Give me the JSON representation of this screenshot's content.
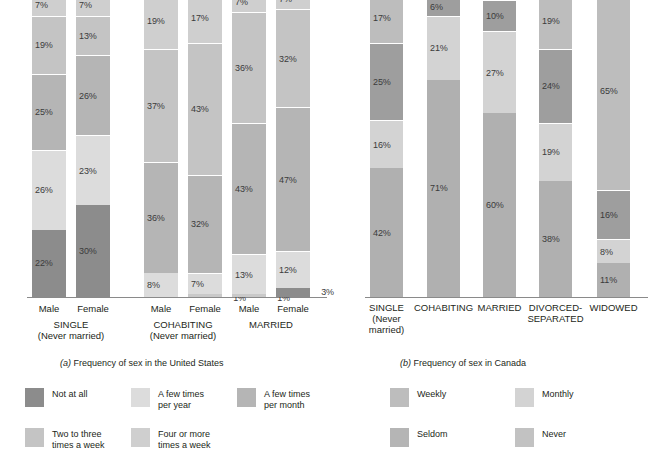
{
  "chart_data": [
    {
      "type": "bar",
      "id": "us",
      "title": "Frequency of sex in the United States",
      "caption_prefix": "(a)",
      "stacked": true,
      "orientation": "vertical",
      "normalized_percent": true,
      "ylim": [
        0,
        100
      ],
      "grid": false,
      "legend_position": "bottom-left",
      "categories": [
        "SINGLE\n(Never married)",
        "COHABITING\n(Never married)",
        "MARRIED"
      ],
      "subcategories": [
        "Male",
        "Female"
      ],
      "series": [
        {
          "name": "Not at all",
          "color": "#8c8c8c",
          "values": [
            22,
            30,
            0,
            0,
            0,
            3
          ]
        },
        {
          "name": "A few times per year",
          "color": "#dcdcdc",
          "values": [
            26,
            23,
            8,
            7,
            13,
            12
          ]
        },
        {
          "name": "A few times per month",
          "color": "#b5b5b5",
          "values": [
            25,
            26,
            36,
            32,
            43,
            47
          ]
        },
        {
          "name": "Two to three times a week",
          "color": "#c4c4c4",
          "values": [
            19,
            13,
            37,
            43,
            36,
            32
          ]
        },
        {
          "name": "Four or more times a week",
          "color": "#cfcfcf",
          "values": [
            7,
            7,
            19,
            17,
            7,
            7
          ]
        }
      ],
      "groups": [
        {
          "label_line1": "SINGLE",
          "label_line2": "(Never married)",
          "bars": [
            {
              "name": "Male",
              "segments": [
                {
                  "label": "22%",
                  "value": 22,
                  "series": "Not at all",
                  "color": "#8c8c8c",
                  "label_pos": "in"
                },
                {
                  "label": "26%",
                  "value": 26,
                  "series": "A few times per year",
                  "color": "#dcdcdc",
                  "label_pos": "in"
                },
                {
                  "label": "25%",
                  "value": 25,
                  "series": "A few times per month",
                  "color": "#b5b5b5",
                  "label_pos": "in"
                },
                {
                  "label": "19%",
                  "value": 19,
                  "series": "Two to three times a week",
                  "color": "#c4c4c4",
                  "label_pos": "in"
                },
                {
                  "label": "7%",
                  "value": 7,
                  "series": "Four or more times a week",
                  "color": "#cfcfcf",
                  "label_pos": "in"
                }
              ]
            },
            {
              "name": "Female",
              "segments": [
                {
                  "label": "30%",
                  "value": 30,
                  "series": "Not at all",
                  "color": "#8c8c8c",
                  "label_pos": "in"
                },
                {
                  "label": "23%",
                  "value": 23,
                  "series": "A few times per year",
                  "color": "#dcdcdc",
                  "label_pos": "in"
                },
                {
                  "label": "26%",
                  "value": 26,
                  "series": "A few times per month",
                  "color": "#b5b5b5",
                  "label_pos": "in"
                },
                {
                  "label": "13%",
                  "value": 13,
                  "series": "Two to three times a week",
                  "color": "#c4c4c4",
                  "label_pos": "in"
                },
                {
                  "label": "7%",
                  "value": 7,
                  "series": "Four or more times a week",
                  "color": "#cfcfcf",
                  "label_pos": "in"
                }
              ]
            }
          ]
        },
        {
          "label_line1": "COHABITING",
          "label_line2": "(Never married)",
          "bars": [
            {
              "name": "Male",
              "segments": [
                {
                  "label": "",
                  "value": 0,
                  "series": "Not at all",
                  "color": "#8c8c8c",
                  "label_pos": "none"
                },
                {
                  "label": "8%",
                  "value": 8,
                  "series": "A few times per year",
                  "color": "#dcdcdc",
                  "label_pos": "in"
                },
                {
                  "label": "36%",
                  "value": 36,
                  "series": "A few times per month",
                  "color": "#b5b5b5",
                  "label_pos": "in"
                },
                {
                  "label": "37%",
                  "value": 37,
                  "series": "Two to three times a week",
                  "color": "#c4c4c4",
                  "label_pos": "in"
                },
                {
                  "label": "19%",
                  "value": 19,
                  "series": "Four or more times a week",
                  "color": "#cfcfcf",
                  "label_pos": "in"
                }
              ]
            },
            {
              "name": "Female",
              "segments": [
                {
                  "label": "1%",
                  "value": 1,
                  "series": "Not at all",
                  "color": "#c9c9c9",
                  "label_pos": "right"
                },
                {
                  "label": "7%",
                  "value": 7,
                  "series": "A few times per year",
                  "color": "#dcdcdc",
                  "label_pos": "in"
                },
                {
                  "label": "32%",
                  "value": 32,
                  "series": "A few times per month",
                  "color": "#b5b5b5",
                  "label_pos": "in"
                },
                {
                  "label": "43%",
                  "value": 43,
                  "series": "Two to three times a week",
                  "color": "#c4c4c4",
                  "label_pos": "in"
                },
                {
                  "label": "17%",
                  "value": 17,
                  "series": "Four or more times a week",
                  "color": "#cfcfcf",
                  "label_pos": "in"
                }
              ]
            }
          ]
        },
        {
          "label_line1": "MARRIED",
          "label_line2": "",
          "bars": [
            {
              "name": "Male",
              "segments": [
                {
                  "label": "1%",
                  "value": 1,
                  "series": "Not at all",
                  "color": "#c9c9c9",
                  "label_pos": "right"
                },
                {
                  "label": "13%",
                  "value": 13,
                  "series": "A few times per year",
                  "color": "#dcdcdc",
                  "label_pos": "in"
                },
                {
                  "label": "43%",
                  "value": 43,
                  "series": "A few times per month",
                  "color": "#b5b5b5",
                  "label_pos": "in"
                },
                {
                  "label": "36%",
                  "value": 36,
                  "series": "Two to three times a week",
                  "color": "#c4c4c4",
                  "label_pos": "in"
                },
                {
                  "label": "7%",
                  "value": 7,
                  "series": "Four or more times a week",
                  "color": "#cfcfcf",
                  "label_pos": "in"
                }
              ]
            },
            {
              "name": "Female",
              "segments": [
                {
                  "label": "3%",
                  "value": 3,
                  "series": "Not at all",
                  "color": "#8c8c8c",
                  "label_pos": "right"
                },
                {
                  "label": "12%",
                  "value": 12,
                  "series": "A few times per year",
                  "color": "#dcdcdc",
                  "label_pos": "in"
                },
                {
                  "label": "47%",
                  "value": 47,
                  "series": "A few times per month",
                  "color": "#b5b5b5",
                  "label_pos": "in"
                },
                {
                  "label": "32%",
                  "value": 32,
                  "series": "Two to three times a week",
                  "color": "#c4c4c4",
                  "label_pos": "in"
                },
                {
                  "label": "7%",
                  "value": 7,
                  "series": "Four or more times a week",
                  "color": "#cfcfcf",
                  "label_pos": "in"
                }
              ]
            }
          ]
        }
      ],
      "legend": [
        {
          "label": "Not at all",
          "color": "#8c8c8c"
        },
        {
          "label": "A few times\nper year",
          "color": "#dcdcdc"
        },
        {
          "label": "A few times\nper month",
          "color": "#b5b5b5"
        },
        {
          "label": "Two to three\ntimes a week",
          "color": "#c4c4c4"
        },
        {
          "label": "Four or more\ntimes a week",
          "color": "#cfcfcf"
        }
      ]
    },
    {
      "type": "bar",
      "id": "ca",
      "title": "Frequency of sex in Canada",
      "caption_prefix": "(b)",
      "stacked": true,
      "orientation": "vertical",
      "normalized_percent": true,
      "ylim": [
        0,
        100
      ],
      "grid": false,
      "legend_position": "bottom-right",
      "categories": [
        "SINGLE (Never married)",
        "COHABITING",
        "MARRIED",
        "DIVORCED-SEPARATED",
        "WIDOWED"
      ],
      "series": [
        {
          "name": "Never",
          "color": "#b0b0b0",
          "values": [
            42,
            71,
            60,
            38,
            11
          ]
        },
        {
          "name": "Seldom",
          "color": "#d3d3d3",
          "values": [
            16,
            21,
            27,
            19,
            8
          ]
        },
        {
          "name": "Monthly",
          "color": "#9e9e9e",
          "values": [
            25,
            6,
            10,
            24,
            16
          ]
        },
        {
          "name": "Weekly",
          "color": "#bdbdbd",
          "values": [
            17,
            2,
            3,
            19,
            65
          ]
        }
      ],
      "groups": [
        {
          "label_line1": "SINGLE",
          "label_line2": "(Never",
          "label_line3": "married)",
          "bars": [
            {
              "name": "Single",
              "segments": [
                {
                  "label": "42%",
                  "value": 42,
                  "series": "Never",
                  "color": "#b0b0b0",
                  "label_pos": "in"
                },
                {
                  "label": "16%",
                  "value": 16,
                  "series": "Seldom",
                  "color": "#d3d3d3",
                  "label_pos": "in"
                },
                {
                  "label": "25%",
                  "value": 25,
                  "series": "Monthly",
                  "color": "#9e9e9e",
                  "label_pos": "in"
                },
                {
                  "label": "17%",
                  "value": 17,
                  "series": "Weekly",
                  "color": "#bdbdbd",
                  "label_pos": "in"
                }
              ]
            }
          ]
        },
        {
          "label_line1": "COHABITING",
          "label_line2": "",
          "label_line3": "",
          "bars": [
            {
              "name": "Cohabiting",
              "segments": [
                {
                  "label": "71%",
                  "value": 71,
                  "series": "Never",
                  "color": "#b0b0b0",
                  "label_pos": "in"
                },
                {
                  "label": "21%",
                  "value": 21,
                  "series": "Seldom",
                  "color": "#d3d3d3",
                  "label_pos": "in"
                },
                {
                  "label": "6%",
                  "value": 6,
                  "series": "Monthly",
                  "color": "#9e9e9e",
                  "label_pos": "in"
                },
                {
                  "label": "2%",
                  "value": 2,
                  "series": "Weekly",
                  "color": "#bdbdbd",
                  "label_pos": "right"
                }
              ]
            }
          ]
        },
        {
          "label_line1": "MARRIED",
          "label_line2": "",
          "label_line3": "",
          "bars": [
            {
              "name": "Married",
              "segments": [
                {
                  "label": "60%",
                  "value": 60,
                  "series": "Never",
                  "color": "#b0b0b0",
                  "label_pos": "in"
                },
                {
                  "label": "27%",
                  "value": 27,
                  "series": "Seldom",
                  "color": "#d3d3d3",
                  "label_pos": "in"
                },
                {
                  "label": "10%",
                  "value": 10,
                  "series": "Monthly",
                  "color": "#9e9e9e",
                  "label_pos": "in"
                },
                {
                  "label": "3%",
                  "value": 3,
                  "series": "Weekly",
                  "color": "#bdbdbd",
                  "label_pos": "right"
                }
              ]
            }
          ]
        },
        {
          "label_line1": "DIVORCED-",
          "label_line2": "SEPARATED",
          "label_line3": "",
          "bars": [
            {
              "name": "Divorced-Separated",
              "segments": [
                {
                  "label": "38%",
                  "value": 38,
                  "series": "Never",
                  "color": "#b0b0b0",
                  "label_pos": "in"
                },
                {
                  "label": "19%",
                  "value": 19,
                  "series": "Seldom",
                  "color": "#d3d3d3",
                  "label_pos": "in"
                },
                {
                  "label": "24%",
                  "value": 24,
                  "series": "Monthly",
                  "color": "#9e9e9e",
                  "label_pos": "in"
                },
                {
                  "label": "19%",
                  "value": 19,
                  "series": "Weekly",
                  "color": "#bdbdbd",
                  "label_pos": "in"
                }
              ]
            }
          ]
        },
        {
          "label_line1": "WIDOWED",
          "label_line2": "",
          "label_line3": "",
          "bars": [
            {
              "name": "Widowed",
              "segments": [
                {
                  "label": "11%",
                  "value": 11,
                  "series": "Never",
                  "color": "#b0b0b0",
                  "label_pos": "in"
                },
                {
                  "label": "8%",
                  "value": 8,
                  "series": "Seldom",
                  "color": "#d3d3d3",
                  "label_pos": "in"
                },
                {
                  "label": "16%",
                  "value": 16,
                  "series": "Monthly",
                  "color": "#9e9e9e",
                  "label_pos": "in"
                },
                {
                  "label": "65%",
                  "value": 65,
                  "series": "Weekly",
                  "color": "#bdbdbd",
                  "label_pos": "in"
                }
              ]
            }
          ]
        }
      ],
      "legend": [
        {
          "label": "Weekly",
          "color": "#bdbdbd"
        },
        {
          "label": "Monthly",
          "color": "#d3d3d3"
        },
        {
          "label": "Seldom",
          "color": "#b5b5b5"
        },
        {
          "label": "Never",
          "color": "#c2c2c2"
        }
      ]
    }
  ]
}
